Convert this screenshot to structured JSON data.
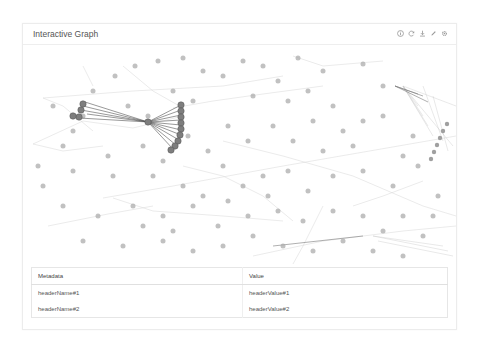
{
  "card": {
    "title": "Interactive Graph",
    "toolbar": [
      {
        "name": "info-icon",
        "label": "Info"
      },
      {
        "name": "refresh-icon",
        "label": "Refresh"
      },
      {
        "name": "download-icon",
        "label": "Download"
      },
      {
        "name": "edit-icon",
        "label": "Edit"
      },
      {
        "name": "gear-icon",
        "label": "Settings"
      }
    ]
  },
  "graph": {
    "node_color": "#9a9a9a",
    "highlight_color": "#555555",
    "edge_color": "#cfcfcf"
  },
  "table": {
    "headers": [
      "Metadata",
      "Value"
    ],
    "rows": [
      [
        "headerName#1",
        "headerValue#1"
      ],
      [
        "headerName#2",
        "headerValue#2"
      ]
    ]
  }
}
